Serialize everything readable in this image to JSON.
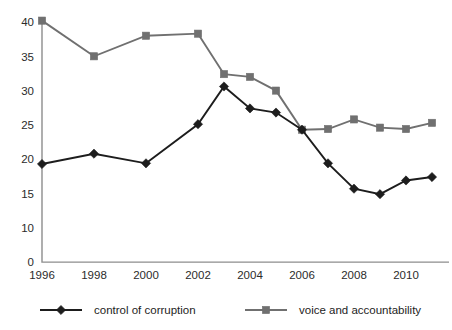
{
  "chart_data": {
    "type": "line",
    "title": "",
    "subtitle": "",
    "xlabel": "",
    "ylabel": "",
    "x": [
      1996,
      1997,
      1998,
      1999,
      2000,
      2001,
      2002,
      2003,
      2004,
      2005,
      2006,
      2007,
      2008,
      2009,
      2010,
      2011
    ],
    "x_ticks": [
      "1996",
      "1998",
      "2000",
      "2002",
      "2004",
      "2006",
      "2008",
      "2010"
    ],
    "x_tick_values": [
      1996,
      1998,
      2000,
      2002,
      2004,
      2006,
      2008,
      2010
    ],
    "y_ticks": [
      "0",
      "10",
      "15",
      "20",
      "25",
      "30",
      "35",
      "40"
    ],
    "y_tick_values": [
      0,
      10,
      15,
      20,
      25,
      30,
      35,
      40
    ],
    "ylim": [
      0,
      40
    ],
    "xlim": [
      1996,
      2011
    ],
    "grid": false,
    "legend_position": "bottom",
    "axis_note": "y-axis has an implied break: spacing between 0 and 10 equals one 5-unit step",
    "series": [
      {
        "name": "control of corruption",
        "color": "#1d1d1d",
        "marker": "diamond",
        "x": [
          1996,
          1998,
          2000,
          2002,
          2003,
          2004,
          2005,
          2006,
          2007,
          2008,
          2009,
          2010,
          2011
        ],
        "values": [
          19.3,
          20.8,
          19.4,
          25.1,
          30.6,
          27.4,
          26.8,
          24.3,
          19.4,
          15.7,
          14.9,
          16.9,
          17.4
        ]
      },
      {
        "name": "voice and accountability",
        "color": "#707070",
        "marker": "square",
        "x": [
          1996,
          1998,
          2000,
          2002,
          2003,
          2004,
          2005,
          2006,
          2007,
          2008,
          2009,
          2010,
          2011
        ],
        "values": [
          40.2,
          35.0,
          38.0,
          38.3,
          32.4,
          32.0,
          30.0,
          24.3,
          24.4,
          25.8,
          24.6,
          24.4,
          25.3
        ]
      }
    ]
  },
  "legend": {
    "items": [
      {
        "label": "control of corruption",
        "color": "#1d1d1d",
        "marker": "diamond"
      },
      {
        "label": "voice and accountability",
        "color": "#707070",
        "marker": "square"
      }
    ]
  }
}
